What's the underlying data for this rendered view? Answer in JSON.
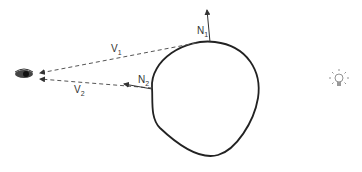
{
  "diagram": {
    "labels": {
      "v1": {
        "main": "V",
        "sub": "1"
      },
      "v2": {
        "main": "V",
        "sub": "2"
      },
      "n1": {
        "main": "N",
        "sub": "1"
      },
      "n2": {
        "main": "N",
        "sub": "2"
      }
    },
    "icons": {
      "viewer": "eye-icon",
      "light": "light-bulb-icon"
    },
    "colors": {
      "stroke": "#222222",
      "dash": "#555555",
      "text": "#333333"
    }
  }
}
